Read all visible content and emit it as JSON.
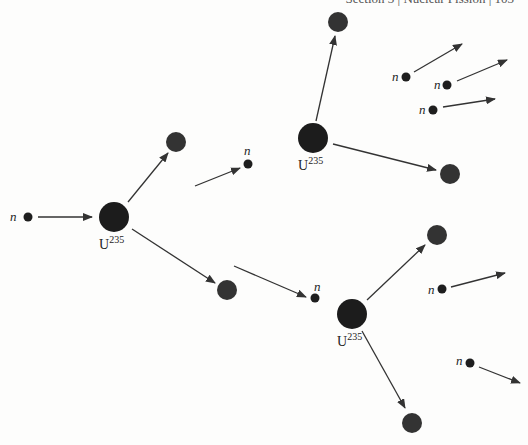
{
  "header": {
    "text": "Section 3  |  Nuclear Fission  |  103"
  },
  "colors": {
    "nucleus": "#1c1c1c",
    "fragment": "#333333",
    "neutron": "#1e1e1e",
    "arrow": "#333333"
  },
  "labels": {
    "neutron": "n",
    "uranium_base": "U",
    "uranium_mass": "235"
  },
  "nuclei": [
    {
      "id": "u1",
      "x": 114,
      "y": 217,
      "r": 15
    },
    {
      "id": "u2",
      "x": 313,
      "y": 138,
      "r": 15
    },
    {
      "id": "u3",
      "x": 352,
      "y": 314,
      "r": 15
    }
  ],
  "fragments": [
    {
      "x": 176,
      "y": 142,
      "r": 10
    },
    {
      "x": 227,
      "y": 290,
      "r": 10
    },
    {
      "x": 338,
      "y": 22,
      "r": 10
    },
    {
      "x": 450,
      "y": 174,
      "r": 10
    },
    {
      "x": 437,
      "y": 235,
      "r": 10
    },
    {
      "x": 412,
      "y": 423,
      "r": 10
    }
  ],
  "neutrons": [
    {
      "x": 28,
      "y": 217,
      "label": true,
      "lx": 10,
      "ly": 221
    },
    {
      "x": 248,
      "y": 164,
      "label": true,
      "lx": 244,
      "ly": 155
    },
    {
      "x": 315,
      "y": 298,
      "label": true,
      "lx": 314,
      "ly": 291
    },
    {
      "x": 406,
      "y": 77,
      "label": true,
      "lx": 392,
      "ly": 81
    },
    {
      "x": 447,
      "y": 85,
      "label": true,
      "lx": 434,
      "ly": 89
    },
    {
      "x": 433,
      "y": 110,
      "label": true,
      "lx": 419,
      "ly": 114
    },
    {
      "x": 442,
      "y": 289,
      "label": true,
      "lx": 428,
      "ly": 294
    },
    {
      "x": 470,
      "y": 363,
      "label": true,
      "lx": 456,
      "ly": 365
    }
  ],
  "arrows": [
    {
      "x1": 38,
      "y1": 217,
      "x2": 92,
      "y2": 217
    },
    {
      "x1": 128,
      "y1": 202,
      "x2": 168,
      "y2": 153
    },
    {
      "x1": 132,
      "y1": 229,
      "x2": 215,
      "y2": 283
    },
    {
      "x1": 195,
      "y1": 186,
      "x2": 240,
      "y2": 168
    },
    {
      "x1": 234,
      "y1": 266,
      "x2": 306,
      "y2": 297
    },
    {
      "x1": 316,
      "y1": 121,
      "x2": 335,
      "y2": 36
    },
    {
      "x1": 333,
      "y1": 144,
      "x2": 436,
      "y2": 170
    },
    {
      "x1": 414,
      "y1": 72,
      "x2": 462,
      "y2": 44
    },
    {
      "x1": 457,
      "y1": 81,
      "x2": 507,
      "y2": 60
    },
    {
      "x1": 443,
      "y1": 107,
      "x2": 495,
      "y2": 99
    },
    {
      "x1": 367,
      "y1": 300,
      "x2": 425,
      "y2": 245
    },
    {
      "x1": 451,
      "y1": 287,
      "x2": 505,
      "y2": 273
    },
    {
      "x1": 362,
      "y1": 331,
      "x2": 405,
      "y2": 408
    },
    {
      "x1": 479,
      "y1": 367,
      "x2": 520,
      "y2": 383
    }
  ]
}
